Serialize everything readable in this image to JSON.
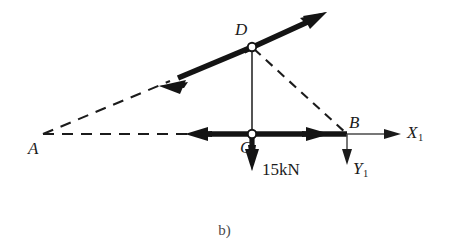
{
  "figure": {
    "caption": "b)",
    "background_color": "#ffffff",
    "stroke_color": "#1b1b1b",
    "thin_stroke_color": "#555555",
    "width": 449,
    "height": 251
  },
  "nodes": [
    {
      "id": "A",
      "label": "A",
      "x": 43,
      "y": 134,
      "pin": false,
      "label_x": 28,
      "label_y": 140
    },
    {
      "id": "B",
      "label": "B",
      "x": 347,
      "y": 134,
      "pin": false,
      "label_x": 349,
      "label_y": 114
    },
    {
      "id": "C",
      "label": "C",
      "x": 252,
      "y": 134,
      "pin": true,
      "label_x": 240,
      "label_y": 139
    },
    {
      "id": "D",
      "label": "D",
      "x": 252,
      "y": 47,
      "pin": true,
      "label_x": 235,
      "label_y": 21
    }
  ],
  "members": [
    {
      "id": "AD",
      "from": "A",
      "to": "D",
      "style": "dashed",
      "weight": "thin"
    },
    {
      "id": "AB",
      "from": "A",
      "to": "B",
      "style": "dashed",
      "weight": "thin"
    },
    {
      "id": "DB",
      "from": "D",
      "to": "B",
      "style": "dashed",
      "weight": "thin"
    },
    {
      "id": "DC",
      "from": "D",
      "to": "C",
      "style": "solid",
      "weight": "thin"
    }
  ],
  "force_vectors": [
    {
      "id": "force-D-upper-right",
      "at_node": "D",
      "direction": "up-right",
      "weight": "bold",
      "tip_x": 327,
      "tip_y": 12,
      "tail_x": 252,
      "tail_y": 47,
      "label": ""
    },
    {
      "id": "force-D-lower-left",
      "at_node": "D",
      "direction": "down-left",
      "weight": "bold",
      "tip_x": 159,
      "tip_y": 86,
      "tail_x": 252,
      "tail_y": 47,
      "label": ""
    },
    {
      "id": "force-C-left",
      "at_node": "C",
      "direction": "left",
      "weight": "bold",
      "tip_x": 185,
      "tip_y": 134,
      "tail_x": 252,
      "tail_y": 134,
      "label": ""
    },
    {
      "id": "force-C-to-B-right",
      "at_node": "C",
      "direction": "right",
      "weight": "bold",
      "tip_x": 330,
      "tip_y": 134,
      "tail_x": 252,
      "tail_y": 134,
      "label": ""
    },
    {
      "id": "load-C-down",
      "at_node": "C",
      "direction": "down",
      "weight": "bold",
      "tip_x": 252,
      "tip_y": 170,
      "tail_x": 252,
      "tail_y": 134,
      "label": "15kN",
      "label_x": 262,
      "label_y": 161
    }
  ],
  "axes": [
    {
      "id": "x1-axis",
      "label": "X",
      "subscript": "1",
      "origin_node": "B",
      "direction": "right",
      "tip_x": 401,
      "tip_y": 134,
      "tail_x": 347,
      "tail_y": 134,
      "label_x": 407,
      "label_y": 124
    },
    {
      "id": "y1-axis",
      "label": "Y",
      "subscript": "1",
      "origin_node": "B",
      "direction": "down",
      "tip_x": 347,
      "tip_y": 164,
      "tail_x": 347,
      "tail_y": 134,
      "label_x": 353,
      "label_y": 160
    }
  ]
}
